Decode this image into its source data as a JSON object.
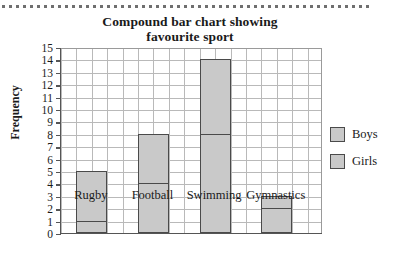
{
  "chart_data": {
    "type": "bar",
    "title": "Compound bar chart showing favourite sport",
    "title_line1": "Compound bar chart showing",
    "title_line2": "favourite sport",
    "xlabel": "",
    "ylabel": "Frequency",
    "ylim": [
      0,
      15
    ],
    "ytick_labels": [
      "15",
      "14",
      "13",
      "12",
      "11",
      "10",
      "9",
      "8",
      "7",
      "6",
      "5",
      "4",
      "3",
      "2",
      "1",
      "0"
    ],
    "categories": [
      "Rugby",
      "Football",
      "Swimming",
      "Gymnastics"
    ],
    "stacked": true,
    "grid": true,
    "legend_position": "right",
    "series": [
      {
        "name": "Boys",
        "values": [
          4,
          4,
          6,
          1
        ],
        "color": "#c9c9c9"
      },
      {
        "name": "Girls",
        "values": [
          1,
          4,
          8,
          2
        ],
        "color": "#c9c9c9"
      }
    ],
    "totals": [
      5,
      8,
      14,
      3
    ],
    "annotations": []
  },
  "legend": {
    "items": [
      {
        "label": "Boys"
      },
      {
        "label": "Girls"
      }
    ]
  },
  "colors": {
    "bar_fill": "#c9c9c9",
    "bar_outline": "#4a4a4a",
    "grid_line": "#b9b9b9",
    "axis": "#555555",
    "background": "#ffffff",
    "text": "#1a1a1a"
  }
}
